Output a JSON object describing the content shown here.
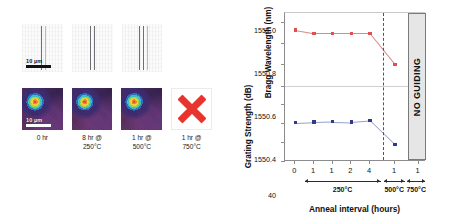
{
  "left_panel": {
    "scale_bar_top": "10 µm",
    "scale_bar_mode": "10 µm",
    "columns": [
      {
        "caption_line1": "0 hr",
        "caption_line2": "",
        "guiding": true,
        "waveguide": true
      },
      {
        "caption_line1": "8 hr @",
        "caption_line2": "250°C",
        "guiding": true,
        "waveguide": true
      },
      {
        "caption_line1": "1 hr @",
        "caption_line2": "500°C",
        "guiding": true,
        "waveguide": true
      },
      {
        "caption_line1": "1 hr @",
        "caption_line2": "750°C",
        "guiding": false,
        "waveguide": false
      }
    ],
    "failure_marker": "red-x"
  },
  "chart_data": {
    "type": "line",
    "title": "",
    "xlabel": "Anneal interval (hours)",
    "x_tick_labels": [
      "0",
      "1",
      "1",
      "2",
      "4",
      "1",
      "1"
    ],
    "x_positions": [
      0,
      1,
      2,
      3,
      4,
      5.35,
      6.6
    ],
    "xlim": [
      -0.55,
      7.0
    ],
    "grid": false,
    "legend_position": "none",
    "temperature_axis": {
      "segments": [
        {
          "label": "250°C",
          "from": 0.55,
          "to": 4.62
        },
        {
          "label": "500°C",
          "from": 4.78,
          "to": 5.92
        },
        {
          "label": "750°C",
          "from": 6.06,
          "to": 7.0
        }
      ]
    },
    "regions": [
      {
        "name": "no-guiding",
        "label": "NO GUIDING",
        "from": 6.06,
        "to": 7.0,
        "color": "#e6e6e6"
      }
    ],
    "divider_at_x": 4.7,
    "subplots": [
      {
        "name": "bragg-wavelength",
        "ylabel": "Bragg Wavelength (nm)",
        "ylim": [
          1550.3,
          1551.08
        ],
        "y_tick_labels": [
          "1551.0",
          "1550.8",
          "1550.6",
          "1550.4"
        ],
        "y_tick_values": [
          1551.0,
          1550.8,
          1550.6,
          1550.4
        ],
        "series": [
          {
            "name": "Bragg wavelength",
            "color": "#e0504e",
            "x": [
              0,
              1,
              2,
              3,
              4,
              5.35
            ],
            "values": [
              1550.92,
              1550.89,
              1550.89,
              1550.89,
              1550.89,
              1550.6
            ]
          }
        ]
      },
      {
        "name": "grating-strength",
        "ylabel": "Grating Strength (dB)",
        "ylim": [
          25,
          42
        ],
        "y_tick_labels": [
          "40",
          "35",
          "30",
          "25"
        ],
        "y_tick_values": [
          40,
          35,
          30,
          25
        ],
        "series": [
          {
            "name": "Grating strength",
            "color": "#2f3a8f",
            "x": [
              0,
              1,
              2,
              3,
              4,
              5.35
            ],
            "values": [
              35.1,
              35.3,
              35.4,
              35.3,
              35.7,
              29.3
            ]
          }
        ]
      }
    ]
  }
}
